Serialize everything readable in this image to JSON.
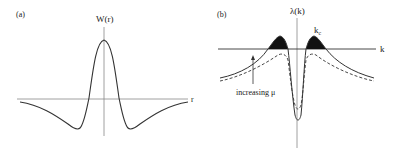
{
  "panel_a": {
    "label": "(a)",
    "y_axis_label": "W(r)",
    "x_axis_label": "r",
    "description": "Mexican-hat shaped weight function W(r): positive peak at r=0, negative lobes on either side decaying to zero"
  },
  "panel_b": {
    "label": "(b)",
    "y_axis_label": "λ(k)",
    "x_axis_label": "k",
    "critical_label": "k",
    "critical_subscript": "c",
    "arrow_label": "increasing μ",
    "description": "Dispersion curves λ(k): solid curve crosses above zero (shaded regions near ±k_c), dashed curve stays below zero; arrow shows increasing μ raises the curve"
  },
  "colors": {
    "line": "#333333",
    "axis": "#888888",
    "fill": "#111111"
  }
}
